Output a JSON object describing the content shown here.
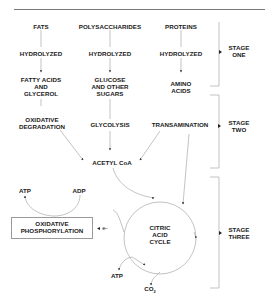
{
  "diagram": {
    "columns": {
      "fats": {
        "source": "FATS",
        "step1": "HYDROLYZED",
        "product": "FATTY ACIDS AND GLYCEROL",
        "product_lines": [
          "FATTY ACIDS",
          "AND",
          "GLYCEROL"
        ],
        "step2_lines": [
          "OXIDATIVE",
          "DEGRADATION"
        ]
      },
      "polysaccharides": {
        "source": "POLYSACCHARIDES",
        "step1": "HYDROLYZED",
        "product": "GLUCOSE AND OTHER SUGARS",
        "product_lines": [
          "GLUCOSE",
          "AND OTHER",
          "SUGARS"
        ],
        "step2": "GLYCOLYSIS"
      },
      "proteins": {
        "source": "PROTEINS",
        "step1": "HYDROLYZED",
        "product": "AMINO ACIDS",
        "product_lines": [
          "AMINO",
          "ACIDS"
        ],
        "step2": "TRANSAMINATION"
      }
    },
    "acetyl_coa": "ACETYL CoA",
    "citric_acid_cycle_lines": [
      "CITRIC",
      "ACID",
      "CYCLE"
    ],
    "oxidative_phosphorylation_lines": [
      "OXIDATIVE",
      "PHOSPHORYLATION"
    ],
    "electron": "e-",
    "atp_top": "ATP",
    "adp": "ADP",
    "atp_bottom": "ATP",
    "co2": "CO",
    "co2_subscript": "2",
    "stages": [
      {
        "line1": "STAGE",
        "line2": "ONE"
      },
      {
        "line1": "STAGE",
        "line2": "TWO"
      },
      {
        "line1": "STAGE",
        "line2": "THREE"
      }
    ]
  },
  "colors": {
    "line": "#8a8a8a",
    "text": "#1a1a1a",
    "rule": "#555555"
  }
}
